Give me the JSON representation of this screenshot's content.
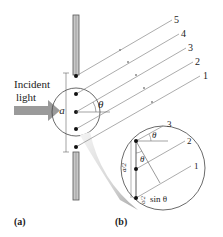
{
  "figure": {
    "incident_label_line1": "Incident",
    "incident_label_line2": "light",
    "slit_width_label": "a",
    "angle_label": "θ",
    "ray_labels": [
      "5",
      "4",
      "3",
      "2",
      "1"
    ],
    "panel_a_label": "(a)",
    "panel_b_label": "(b)",
    "inset": {
      "ray_labels": [
        "3",
        "2",
        "1"
      ],
      "angle_label_top": "θ",
      "angle_label_mid": "θ",
      "half_width_label": "a/2",
      "path_diff_label": "sin θ",
      "path_diff_frac": "a/2"
    },
    "colors": {
      "arrow": "#9a9a9a",
      "wall": "#b8b8b8",
      "ray": "#888888",
      "ink": "#222222"
    }
  }
}
